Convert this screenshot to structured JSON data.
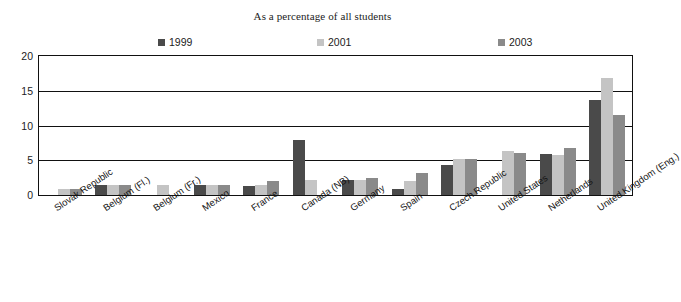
{
  "chart_data": {
    "type": "bar",
    "title": "As a percentage of all students",
    "xlabel": "",
    "ylabel": "",
    "ylim": [
      0,
      20
    ],
    "yticks": [
      0,
      5,
      10,
      15,
      20
    ],
    "grid": true,
    "legend_position": "top",
    "categories": [
      "Slovak Republic",
      "Belgium (Fl.)",
      "Belgium (Fr.)",
      "Mexico",
      "France",
      "Canada (NB)",
      "Germany",
      "Spain",
      "Czech Republic",
      "United States",
      "Netherlands",
      "United Kingdom (Eng.)"
    ],
    "series": [
      {
        "name": "1999",
        "color": "#4a4a4a",
        "values": [
          null,
          1.4,
          null,
          1.4,
          1.3,
          7.9,
          2.2,
          0.9,
          4.3,
          null,
          5.9,
          13.7
        ]
      },
      {
        "name": "2001",
        "color": "#c4c4c4",
        "values": [
          0.8,
          1.5,
          1.5,
          1.4,
          1.4,
          2.2,
          2.2,
          2.0,
          5.2,
          6.4,
          5.8,
          16.9
        ]
      },
      {
        "name": "2003",
        "color": "#8a8a8a",
        "values": [
          0.8,
          1.5,
          null,
          1.5,
          2.0,
          null,
          2.5,
          3.1,
          5.2,
          6.0,
          6.8,
          11.5
        ]
      }
    ]
  }
}
